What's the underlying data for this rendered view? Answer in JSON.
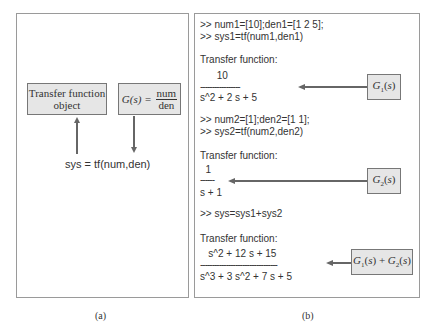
{
  "panel_a": {
    "tf_object_box": "Transfer function object",
    "tf_object_line1": "Transfer function",
    "tf_object_line2": "object",
    "gs_lhs": "G(s) =",
    "gs_num": "num",
    "gs_den": "den",
    "command": "sys = tf(num,den)",
    "caption": "(a)"
  },
  "panel_b": {
    "lines": {
      "cmd1": ">> num1=[10];den1=[1 2 5];",
      "cmd2": ">> sys1=tf(num1,den1)",
      "tf1_label": "Transfer function:",
      "tf1_num": "      10",
      "tf1_bar": "-----------------",
      "tf1_den": "s^2 + 2 s + 5",
      "cmd3": ">> num2=[1];den2=[1 1];",
      "cmd4": ">> sys2=tf(num2,den2)",
      "tf2_label": "Transfer function:",
      "tf2_num": "  1",
      "tf2_bar": "------",
      "tf2_den": "s + 1",
      "cmd5": ">> sys=sys1+sys2",
      "tf3_label": "Transfer function:",
      "tf3_num": "   s^2 + 12 s + 15",
      "tf3_bar": "---------------------------------",
      "tf3_den": "s^3 + 3 s^2 + 7 s + 5"
    },
    "labels": {
      "g1": "G1(s)",
      "g2": "G2(s)",
      "sum": "G1(s) + G2(s)"
    },
    "caption": "(b)"
  },
  "colors": {
    "box_fill": "#e6e6e6",
    "arrow": "#666666",
    "border": "#9a9a9a"
  }
}
